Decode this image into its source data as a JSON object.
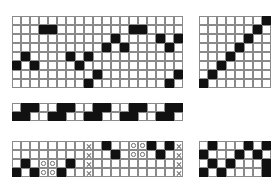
{
  "figure": {
    "background_color": "#ffffff",
    "fill_color": "#111111",
    "line_color": "#8a8a8a",
    "marker_color": "#6e6e6e",
    "legend": {
      "filled": "filled-cell",
      "circle": "circle-marker-cell",
      "cross": "x-marker-cell",
      "empty": "empty-cell"
    }
  },
  "grids": [
    {
      "name": "top-left-grid",
      "rows": 8,
      "cols": 19,
      "cell_size": 9,
      "x": 12,
      "y": 16,
      "cells": [
        [
          "e",
          "e",
          "e",
          "e",
          "e",
          "e",
          "e",
          "e",
          "e",
          "e",
          "e",
          "e",
          "e",
          "e",
          "e",
          "e",
          "e",
          "e",
          "e"
        ],
        [
          "e",
          "e",
          "e",
          "f",
          "f",
          "e",
          "e",
          "e",
          "e",
          "e",
          "e",
          "e",
          "e",
          "f",
          "f",
          "e",
          "e",
          "e",
          "e"
        ],
        [
          "e",
          "e",
          "e",
          "e",
          "e",
          "e",
          "e",
          "e",
          "e",
          "e",
          "e",
          "f",
          "e",
          "e",
          "e",
          "e",
          "f",
          "e",
          "f"
        ],
        [
          "e",
          "e",
          "e",
          "e",
          "e",
          "e",
          "e",
          "e",
          "e",
          "e",
          "f",
          "e",
          "f",
          "e",
          "e",
          "e",
          "e",
          "f",
          "e"
        ],
        [
          "e",
          "f",
          "e",
          "e",
          "e",
          "e",
          "f",
          "e",
          "f",
          "e",
          "e",
          "e",
          "e",
          "e",
          "e",
          "e",
          "e",
          "e",
          "e"
        ],
        [
          "f",
          "e",
          "f",
          "e",
          "e",
          "e",
          "e",
          "f",
          "e",
          "e",
          "e",
          "e",
          "e",
          "e",
          "e",
          "e",
          "e",
          "e",
          "e"
        ],
        [
          "e",
          "e",
          "e",
          "e",
          "e",
          "e",
          "e",
          "e",
          "e",
          "f",
          "e",
          "e",
          "e",
          "e",
          "e",
          "e",
          "e",
          "e",
          "f"
        ],
        [
          "e",
          "e",
          "e",
          "e",
          "e",
          "e",
          "e",
          "e",
          "f",
          "e",
          "e",
          "e",
          "e",
          "e",
          "e",
          "e",
          "e",
          "f",
          "e"
        ]
      ]
    },
    {
      "name": "top-right-grid",
      "rows": 8,
      "cols": 8,
      "cell_size": 9,
      "x": 199,
      "y": 16,
      "cells": [
        [
          "e",
          "e",
          "e",
          "e",
          "e",
          "e",
          "e",
          "f"
        ],
        [
          "e",
          "e",
          "e",
          "e",
          "e",
          "e",
          "f",
          "e"
        ],
        [
          "e",
          "e",
          "e",
          "e",
          "e",
          "f",
          "e",
          "e"
        ],
        [
          "e",
          "e",
          "e",
          "e",
          "f",
          "e",
          "e",
          "e"
        ],
        [
          "e",
          "e",
          "e",
          "f",
          "e",
          "e",
          "e",
          "e"
        ],
        [
          "e",
          "e",
          "f",
          "e",
          "e",
          "e",
          "e",
          "e"
        ],
        [
          "e",
          "f",
          "e",
          "e",
          "e",
          "e",
          "e",
          "e"
        ],
        [
          "f",
          "e",
          "e",
          "e",
          "e",
          "e",
          "e",
          "e"
        ]
      ]
    },
    {
      "name": "middle-strip-grid",
      "rows": 2,
      "cols": 19,
      "cell_size": 9,
      "x": 12,
      "y": 103,
      "cells": [
        [
          "e",
          "f",
          "f",
          "e",
          "e",
          "f",
          "f",
          "e",
          "e",
          "f",
          "f",
          "e",
          "e",
          "f",
          "f",
          "e",
          "e",
          "f",
          "f"
        ],
        [
          "f",
          "f",
          "e",
          "e",
          "f",
          "f",
          "e",
          "e",
          "f",
          "f",
          "e",
          "e",
          "f",
          "f",
          "e",
          "e",
          "f",
          "f",
          "e"
        ]
      ]
    },
    {
      "name": "bottom-left-grid",
      "rows": 4,
      "cols": 19,
      "cell_size": 9,
      "x": 12,
      "y": 141,
      "cells": [
        [
          "e",
          "e",
          "e",
          "e",
          "e",
          "e",
          "e",
          "e",
          "x",
          "e",
          "f",
          "e",
          "e",
          "c",
          "c",
          "f",
          "e",
          "f",
          "x"
        ],
        [
          "e",
          "e",
          "e",
          "e",
          "e",
          "e",
          "e",
          "e",
          "x",
          "e",
          "e",
          "f",
          "e",
          "c",
          "c",
          "e",
          "f",
          "e",
          "x"
        ],
        [
          "e",
          "f",
          "e",
          "c",
          "c",
          "e",
          "f",
          "e",
          "x",
          "e",
          "e",
          "e",
          "e",
          "e",
          "e",
          "e",
          "e",
          "e",
          "x"
        ],
        [
          "f",
          "e",
          "f",
          "c",
          "c",
          "f",
          "e",
          "e",
          "x",
          "e",
          "e",
          "e",
          "e",
          "e",
          "e",
          "e",
          "e",
          "e",
          "x"
        ]
      ]
    },
    {
      "name": "bottom-right-grid",
      "rows": 4,
      "cols": 8,
      "cell_size": 9,
      "x": 199,
      "y": 141,
      "cells": [
        [
          "e",
          "f",
          "e",
          "e",
          "e",
          "f",
          "e",
          "f"
        ],
        [
          "f",
          "e",
          "e",
          "e",
          "f",
          "e",
          "f",
          "e"
        ],
        [
          "e",
          "f",
          "e",
          "f",
          "e",
          "e",
          "e",
          "f"
        ],
        [
          "f",
          "e",
          "f",
          "e",
          "e",
          "e",
          "e",
          "f"
        ]
      ]
    }
  ]
}
